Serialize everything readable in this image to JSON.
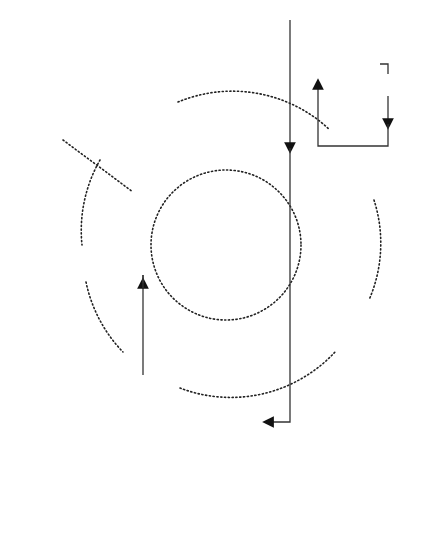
{
  "diagram": {
    "top_stack": {
      "input": "Input",
      "process": "Process",
      "output": "Output"
    },
    "bottom_stack": {
      "process": "Process",
      "output": "Output"
    },
    "labels": {
      "assessment_of_expectation": "Assessment\nof\nexpectation",
      "assessment_of_quality": "Assessment\nof quality",
      "expectation": "Expectation",
      "comparison": "Comparison of\ninput with\nexpectation",
      "corrective_action": "Corrective action"
    },
    "colors": {
      "line": "#333333",
      "arrow_fill": "#b0b0b0",
      "dots": "#222222"
    }
  }
}
